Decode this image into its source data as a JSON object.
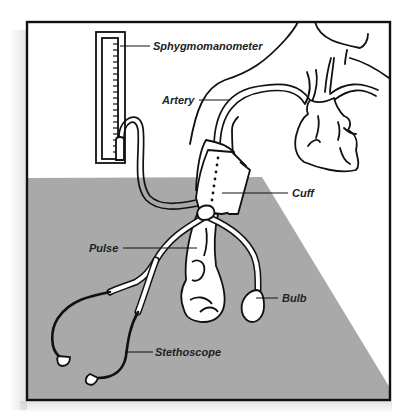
{
  "diagram": {
    "colors": {
      "background": "#ffffff",
      "floor": "#a9a9a9",
      "line": "#111111",
      "frame": "#111111"
    },
    "labels": [
      {
        "id": "sphygmomanometer",
        "text": "Sphygmomanometer"
      },
      {
        "id": "artery",
        "text": "Artery"
      },
      {
        "id": "cuff",
        "text": "Cuff"
      },
      {
        "id": "pulse",
        "text": "Pulse"
      },
      {
        "id": "bulb",
        "text": "Bulb"
      },
      {
        "id": "stethoscope",
        "text": "Stethoscope"
      }
    ]
  }
}
